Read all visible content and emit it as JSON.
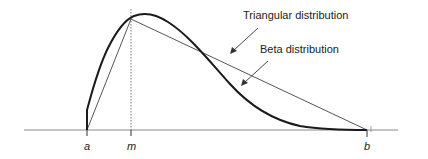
{
  "diagram": {
    "axis_labels": {
      "a": "a",
      "m": "m",
      "b": "b"
    },
    "annotations": {
      "triangular": "Triangular distribution",
      "beta": "Beta distribution"
    },
    "colors": {
      "axis": "#8a8a8a",
      "triangle": "#555555",
      "beta": "#1a1a1a",
      "mode_line": "#555555",
      "text": "#222222"
    }
  }
}
